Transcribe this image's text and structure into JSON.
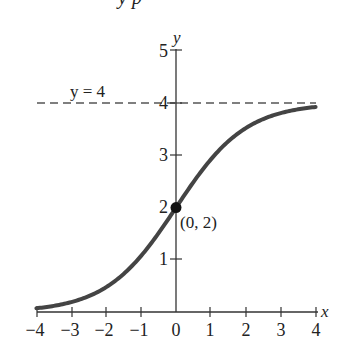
{
  "header": {
    "cutoff_text": "y·p"
  },
  "chart_data": {
    "type": "line",
    "title": "",
    "xlabel": "x",
    "ylabel": "y",
    "xlim": [
      -4,
      4
    ],
    "ylim": [
      0,
      5
    ],
    "grid": false,
    "x_ticks": [
      "−4",
      "−3",
      "−2",
      "−1",
      "0",
      "1",
      "2",
      "3",
      "4"
    ],
    "y_ticks": [
      "1",
      "2",
      "3",
      "4",
      "5"
    ],
    "series": [
      {
        "name": "y = 4/(1 + e^(−x))",
        "x": [
          -4,
          -3,
          -2,
          -1,
          0,
          1,
          2,
          3,
          4
        ],
        "values": [
          0.072,
          0.19,
          0.477,
          1.076,
          2.0,
          2.924,
          3.523,
          3.81,
          3.928
        ],
        "color": "#444444"
      }
    ],
    "asymptote": {
      "label": "y = 4",
      "value": 4,
      "style": "dashed"
    },
    "annotations": [
      {
        "label": "(0, 2)",
        "x": 0,
        "y": 2,
        "marker": "filled-circle"
      }
    ]
  }
}
